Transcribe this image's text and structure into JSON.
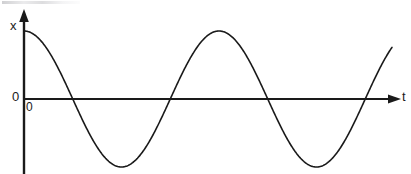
{
  "figure": {
    "background_color": "#ffffff",
    "ink_color": "#1a1a1a",
    "width": 411,
    "height": 174
  },
  "labels": {
    "y_axis_name": "x",
    "x_axis_name": "t",
    "origin_left": "0",
    "origin_below": "0"
  },
  "axes": {
    "origin_px": {
      "x": 24,
      "y": 99
    },
    "y_axis": {
      "name": "x",
      "x_px": 24,
      "top_px": 12,
      "bottom_px": 174,
      "arrow": "up",
      "ticks": [],
      "tick_labels": []
    },
    "x_axis": {
      "name": "t",
      "y_px": 99,
      "left_px": 24,
      "right_px": 400,
      "arrow": "right",
      "ticks": [],
      "tick_labels": []
    },
    "grid": false
  },
  "chart_data": {
    "type": "line",
    "title": "",
    "subtitle": "",
    "xlabel": "t",
    "ylabel": "x",
    "grid": false,
    "legend": null,
    "legend_position": "none",
    "annotations": [
      {
        "text": "0",
        "role": "origin-label-left-of-y-axis",
        "x_px": 14,
        "y_px": 97
      },
      {
        "text": "0",
        "role": "origin-label-below-right",
        "x_px": 27,
        "y_px": 108
      },
      {
        "text": "x",
        "role": "y-axis-name",
        "x_px": 14,
        "y_px": 25
      },
      {
        "text": "t",
        "role": "x-axis-name",
        "x_px": 404,
        "y_px": 97
      }
    ],
    "xlim": [
      0,
      1.93
    ],
    "ylim": [
      -1.08,
      1.08
    ],
    "series": [
      {
        "name": "x(t)",
        "color": "#1a1a1a",
        "line_width": 1.6,
        "waveform": "cosine",
        "amplitude": 1.0,
        "period": 1.0,
        "phase_deg": 0,
        "equation": "x = A cos(2πt/T)",
        "x": [
          0.0,
          0.05,
          0.1,
          0.15,
          0.2,
          0.25,
          0.3,
          0.35,
          0.4,
          0.45,
          0.5,
          0.55,
          0.6,
          0.65,
          0.7,
          0.75,
          0.8,
          0.85,
          0.9,
          0.95,
          1.0,
          1.05,
          1.1,
          1.15,
          1.2,
          1.25,
          1.3,
          1.35,
          1.4,
          1.45,
          1.5,
          1.55,
          1.6,
          1.65,
          1.7,
          1.75,
          1.8,
          1.85,
          1.9,
          1.93
        ],
        "values": [
          1.0,
          0.951,
          0.809,
          0.588,
          0.309,
          0.0,
          -0.309,
          -0.588,
          -0.809,
          -0.951,
          -1.0,
          -0.951,
          -0.809,
          -0.588,
          -0.309,
          0.0,
          0.309,
          0.588,
          0.809,
          0.951,
          1.0,
          0.951,
          0.809,
          0.588,
          0.309,
          0.0,
          -0.309,
          -0.588,
          -0.809,
          -0.951,
          -1.0,
          -0.951,
          -0.809,
          -0.588,
          -0.309,
          0.0,
          0.309,
          0.588,
          0.809,
          0.876
        ]
      }
    ],
    "features": {
      "maxima_px": [
        {
          "x": 24,
          "y": 28
        },
        {
          "x": 218,
          "y": 26
        }
      ],
      "minima_px": [
        {
          "x": 121,
          "y": 164
        },
        {
          "x": 316,
          "y": 163
        }
      ],
      "zero_crossings_px": [
        73,
        170,
        268,
        362
      ],
      "curve_start_px": {
        "x": 24,
        "y": 28
      },
      "curve_end_px": {
        "x": 392,
        "y": 47
      },
      "amplitude_px": 68,
      "period_px": 195,
      "cycles_shown": 1.9
    }
  }
}
